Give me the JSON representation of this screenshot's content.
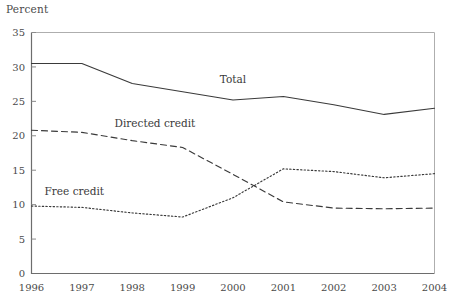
{
  "chart_data": {
    "type": "line",
    "title": "",
    "ylabel": "Percent",
    "xlabel": "",
    "ylim": [
      0,
      35
    ],
    "yticks": [
      0,
      5,
      10,
      15,
      20,
      25,
      30,
      35
    ],
    "grid": false,
    "legend_position": "inline-annotations",
    "x": [
      1996,
      1997,
      1998,
      1999,
      2000,
      2001,
      2002,
      2003,
      2004
    ],
    "categories": [
      "1996",
      "1997",
      "1998",
      "1999",
      "2000",
      "2001",
      "2002",
      "2003",
      "2004"
    ],
    "series": [
      {
        "name": "Total",
        "style": "solid",
        "color": "#3a3a3a",
        "values": [
          30.5,
          30.5,
          27.6,
          26.4,
          25.2,
          25.7,
          24.5,
          23.1,
          24.0
        ],
        "annotation": {
          "label": "Total",
          "x": 2000,
          "y": 27.6
        }
      },
      {
        "name": "Directed credit",
        "style": "dashed",
        "color": "#3a3a3a",
        "values": [
          20.8,
          20.5,
          19.3,
          18.3,
          14.4,
          10.4,
          9.5,
          9.4,
          9.5
        ],
        "annotation": {
          "label": "Directed credit",
          "x": 1998.45,
          "y": 21.3
        }
      },
      {
        "name": "Free credit",
        "style": "dotted",
        "color": "#3a3a3a",
        "values": [
          9.8,
          9.6,
          8.8,
          8.2,
          11.0,
          15.2,
          14.8,
          13.9,
          14.5
        ],
        "annotation": {
          "label": "Free credit",
          "x": 1996.85,
          "y": 11.4
        }
      }
    ]
  },
  "axis": {
    "ytick_labels": [
      "0",
      "5",
      "10",
      "15",
      "20",
      "25",
      "30",
      "35"
    ],
    "xtick_labels": [
      "1996",
      "1997",
      "1998",
      "1999",
      "2000",
      "2001",
      "2002",
      "2003",
      "2004"
    ],
    "percent_label": "Percent"
  },
  "annotations": {
    "total": "Total",
    "directed_credit": "Directed credit",
    "free_credit": "Free credit"
  }
}
